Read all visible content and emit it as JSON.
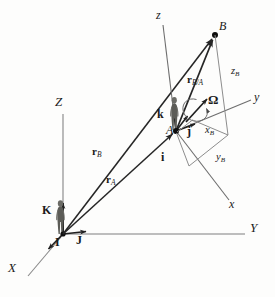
{
  "figure": {
    "kind": "vector-diagram",
    "background_color": "#fdfdfc",
    "line_color": "#3a3a3a",
    "thin_line_color": "#8a8a8a",
    "ink_color": "#1a1a1a",
    "width": 275,
    "height": 297
  },
  "points": [
    {
      "name": "origin",
      "label": "",
      "x": 63,
      "y": 234,
      "filled": true
    },
    {
      "name": "A",
      "label": "A",
      "x": 176,
      "y": 131,
      "filled": true
    },
    {
      "name": "B",
      "label": "B",
      "x": 215,
      "y": 35,
      "filled": true
    }
  ],
  "fixed_frame": {
    "name": "fixed-frame-XYZ",
    "axes": [
      {
        "id": "X",
        "label": "X",
        "label_x": 11,
        "label_y": 268,
        "from": [
          63,
          234
        ],
        "to": [
          26,
          277
        ],
        "arrow": "at-origin"
      },
      {
        "id": "Y",
        "label": "Y",
        "label_x": 252,
        "label_y": 228,
        "from": [
          63,
          234
        ],
        "to": [
          246,
          234
        ],
        "arrow": "none"
      },
      {
        "id": "Z",
        "label": "Z",
        "label_x": 57,
        "label_y": 101,
        "from": [
          63,
          234
        ],
        "to": [
          63,
          116
        ],
        "arrow": "none"
      }
    ],
    "unit_vectors": [
      {
        "id": "I",
        "label": "I",
        "label_x": 55,
        "label_y": 240,
        "tip": [
          46,
          247
        ]
      },
      {
        "id": "J",
        "label": "J",
        "label_x": 76,
        "label_y": 239,
        "tip": [
          88,
          232
        ]
      },
      {
        "id": "K",
        "label": "K",
        "label_x": 44,
        "label_y": 209,
        "tip": [
          63,
          199
        ]
      }
    ]
  },
  "moving_frame": {
    "name": "moving-frame-xyz",
    "origin_point": "A",
    "axes": [
      {
        "id": "x",
        "label": "x",
        "label_x": 232,
        "label_y": 203,
        "from": [
          176,
          131
        ],
        "to": [
          230,
          200
        ]
      },
      {
        "id": "y",
        "label": "y",
        "label_x": 256,
        "label_y": 96,
        "from": [
          176,
          131
        ],
        "to": [
          252,
          101
        ]
      },
      {
        "id": "z",
        "label": "z",
        "label_x": 158,
        "label_y": 14,
        "from": [
          176,
          131
        ],
        "to": [
          163,
          26
        ]
      }
    ],
    "unit_vectors": [
      {
        "id": "i",
        "label": "i",
        "label_x": 164,
        "label_y": 156,
        "tip": [
          162,
          147
        ]
      },
      {
        "id": "j",
        "label": "j",
        "label_x": 189,
        "label_y": 130,
        "tip": [
          196,
          123
        ]
      },
      {
        "id": "k",
        "label": "k",
        "label_x": 159,
        "label_y": 114,
        "tip": [
          176,
          110
        ]
      }
    ]
  },
  "vectors": [
    {
      "id": "r_A",
      "label": "r",
      "subscript": "A",
      "label_x": 110,
      "label_y": 180,
      "from": [
        63,
        234
      ],
      "to": [
        176,
        131
      ],
      "style": "bold-arrow"
    },
    {
      "id": "r_B",
      "label": "r",
      "subscript": "B",
      "label_x": 96,
      "label_y": 152,
      "from": [
        63,
        234
      ],
      "to": [
        215,
        35
      ],
      "style": "bold-arrow"
    },
    {
      "id": "r_B/A",
      "label": "r",
      "subscript": "B/A",
      "label_x": 190,
      "label_y": 80,
      "from": [
        176,
        131
      ],
      "to": [
        215,
        35
      ],
      "style": "bold-arrow"
    }
  ],
  "angular_velocity": {
    "id": "Omega",
    "label": "Ω",
    "label_x": 212,
    "label_y": 101,
    "arrow_from": [
      186,
      122
    ],
    "arrow_to": [
      209,
      98
    ],
    "spin_indicator": "curved-circulation-arrow"
  },
  "coordinate_projections": [
    {
      "id": "z_B",
      "label": "z",
      "subscript": "B",
      "label_x": 234,
      "label_y": 72,
      "from": [
        215,
        35
      ],
      "to": [
        228,
        135
      ]
    },
    {
      "id": "x_B",
      "label": "x",
      "subscript": "B",
      "label_x": 207,
      "label_y": 131,
      "from": [
        228,
        135
      ],
      "to": [
        193,
        120
      ]
    },
    {
      "id": "y_B",
      "label": "y",
      "subscript": "B",
      "label_x": 219,
      "label_y": 158,
      "from": [
        228,
        135
      ],
      "to": [
        190,
        165
      ]
    }
  ],
  "observers": [
    {
      "id": "observer-fixed",
      "at_point": "origin",
      "x": 58,
      "y": 200,
      "description": "standing observer figure at fixed origin"
    },
    {
      "id": "observer-moving",
      "at_point": "A",
      "x": 171,
      "y": 97,
      "description": "standing observer figure at moving point A"
    }
  ]
}
